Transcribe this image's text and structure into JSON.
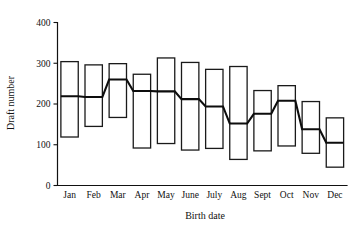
{
  "chart_data": {
    "type": "bar",
    "subtype": "box-plot",
    "title": "",
    "xlabel": "Birth date",
    "ylabel": "Draft number",
    "ylim": [
      0,
      400
    ],
    "yticks": [
      0,
      100,
      200,
      300,
      400
    ],
    "ytick_labels": [
      "0",
      "100",
      "200",
      "300",
      "400"
    ],
    "grid": false,
    "legend": "none",
    "categories": [
      "Jan",
      "Feb",
      "Mar",
      "Apr",
      "May",
      "June",
      "July",
      "Aug",
      "Sept",
      "Oct",
      "Nov",
      "Dec"
    ],
    "box_top": [
      304,
      296,
      299,
      273,
      313,
      302,
      285,
      292,
      233,
      245,
      206,
      166
    ],
    "box_bottom": [
      119,
      145,
      167,
      92,
      103,
      87,
      91,
      64,
      85,
      97,
      79,
      45
    ],
    "median": [
      219,
      217,
      260,
      232,
      231,
      212,
      194,
      152,
      176,
      208,
      138,
      105
    ],
    "series": [
      {
        "name": "Upper quartile",
        "values": [
          304,
          296,
          299,
          273,
          313,
          302,
          285,
          292,
          233,
          245,
          206,
          166
        ]
      },
      {
        "name": "Median",
        "values": [
          219,
          217,
          260,
          232,
          231,
          212,
          194,
          152,
          176,
          208,
          138,
          105
        ]
      },
      {
        "name": "Lower quartile",
        "values": [
          119,
          145,
          167,
          92,
          103,
          87,
          91,
          64,
          85,
          97,
          79,
          45
        ]
      }
    ],
    "colors": {
      "box_fill": "#ffffff",
      "box_stroke": "#1a1a1a",
      "median_line": "#0d0d0d",
      "axis": "#111111",
      "background": "#ffffff"
    }
  }
}
